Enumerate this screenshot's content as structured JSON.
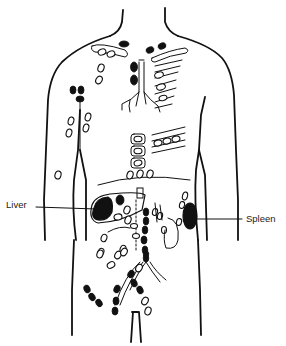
{
  "figure": {
    "labels": {
      "liver": "Liver",
      "spleen": "Spleen"
    },
    "legend_colors": {
      "outline": "#111111",
      "filled_node": "#111111",
      "open_node": "#ffffff",
      "background": "#ffffff"
    }
  }
}
